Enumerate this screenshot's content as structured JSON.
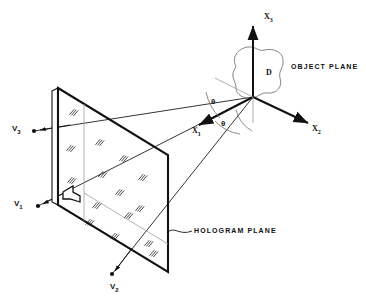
{
  "figure": {
    "name": "holography-recording-geometry",
    "background_color": "#ffffff",
    "ink_color": "#111111",
    "thin_color": "#777777"
  },
  "axes": {
    "origin": {
      "x": 253,
      "y": 97
    },
    "items": [
      {
        "id": "x1",
        "label": "X",
        "subscript": "1",
        "label_x": 194,
        "label_y": 132,
        "tip_x": 197,
        "tip_y": 126,
        "from_x": 253,
        "from_y": 97,
        "style": "bold-arrow"
      },
      {
        "id": "x2",
        "label": "X",
        "subscript": "2",
        "label_x": 312,
        "label_y": 130,
        "tip_x": 310,
        "tip_y": 124,
        "from_x": 253,
        "from_y": 97,
        "style": "bold-arrow"
      },
      {
        "id": "x3",
        "label": "X",
        "subscript": "3",
        "label_x": 264,
        "label_y": 18,
        "tip_x": 253,
        "tip_y": 22,
        "from_x": 253,
        "from_y": 97,
        "style": "bold-arrow"
      }
    ]
  },
  "angles": {
    "symbol": "θ",
    "items": [
      {
        "id": "theta-upper",
        "label": "θ",
        "label_x": 214,
        "label_y": 103
      },
      {
        "id": "theta-lower",
        "label": "θ",
        "label_x": 223,
        "label_y": 124
      }
    ]
  },
  "object": {
    "blob_label": "D",
    "blob_label_x": 268,
    "blob_label_y": 73,
    "caption": "OBJECT PLANE",
    "caption_x": 292,
    "caption_y": 68
  },
  "hologram": {
    "caption": "HOLOGRAM PLANE",
    "caption_x": 196,
    "caption_y": 232,
    "corners": [
      {
        "x": 58,
        "y": 88
      },
      {
        "x": 168,
        "y": 155
      },
      {
        "x": 168,
        "y": 272
      },
      {
        "x": 58,
        "y": 205
      }
    ]
  },
  "sources": [
    {
      "id": "v1",
      "label": "V",
      "subscript": "1",
      "label_x": 14,
      "label_y": 204,
      "dot_x": 36,
      "dot_y": 207
    },
    {
      "id": "v2",
      "label": "V",
      "subscript": "2",
      "label_x": 112,
      "label_y": 287,
      "dot_x": 113,
      "dot_y": 276
    },
    {
      "id": "v3",
      "label": "V",
      "subscript": "3",
      "label_x": 12,
      "label_y": 128,
      "dot_x": 32,
      "dot_y": 131
    }
  ]
}
